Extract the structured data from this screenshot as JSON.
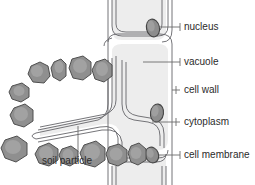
{
  "figure": {
    "background_color": "#ffffff"
  },
  "labels": {
    "nucleus": "nucleus",
    "vacuole": "vacuole",
    "cell_wall": "cell wall",
    "cytoplasm": "cytoplasm",
    "cell_membrane": "cell membrane",
    "soil_particle": "soil particle"
  },
  "colors": {
    "outline": "#58585a",
    "wall_line": "#6e6e70",
    "cytoplasm_fill": "#e9e9e9",
    "wall_fill": "#f4f4f4",
    "nucleus_fill": "#8d8d8d",
    "nucleus_outline": "#4a4a4a",
    "soil_fill": "#8f8f8f",
    "soil_outline": "#4f4f4f",
    "soil_highlight": "#b4b4b4",
    "leader_line": "#6b6b6b",
    "text": "#2b2b2b"
  },
  "structures": {
    "cells": [
      "upper cell",
      "middle root hair cell",
      "lower cell"
    ],
    "nuclei_count": 3,
    "soil_particle_count": 12
  }
}
